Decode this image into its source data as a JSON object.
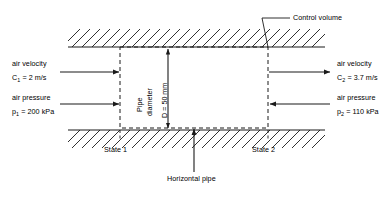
{
  "diagram": {
    "title_note": "Control volume for air flow in a horizontal pipe",
    "colors": {
      "line": "#1a1a1a",
      "background": "#ffffff"
    },
    "labels": {
      "control_volume": "Control volume",
      "horizontal_pipe": "Horizontal pipe",
      "state_1": "State 1",
      "state_2": "State 2",
      "pipe_diameter_line1": "Pipe",
      "pipe_diameter_line2": "diameter",
      "pipe_diameter_value": "D = 50 mm"
    },
    "inlet": {
      "velocity_title": "air velocity",
      "velocity_symbol": "C",
      "velocity_subscript": "1",
      "velocity_value": "= 2 m/s",
      "pressure_title": "air pressure",
      "pressure_symbol": "p",
      "pressure_subscript": "1",
      "pressure_value": "= 200 kPa"
    },
    "outlet": {
      "velocity_title": "air velocity",
      "velocity_symbol": "C",
      "velocity_subscript": "2",
      "velocity_value": "= 3.7 m/s",
      "pressure_title": "air pressure",
      "pressure_symbol": "p",
      "pressure_subscript": "2",
      "pressure_value": "= 110 kPa"
    }
  }
}
